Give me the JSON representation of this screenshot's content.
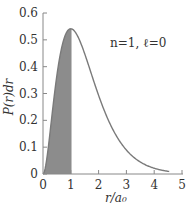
{
  "chart_data": {
    "type": "area",
    "title": "",
    "annotation": "n=1,  ℓ=0",
    "xlabel": "r/a₀",
    "ylabel": "P(r)dr",
    "xlim": [
      0,
      5
    ],
    "ylim": [
      0,
      0.6
    ],
    "xticks": [
      "0",
      "1",
      "2",
      "3",
      "4",
      "5"
    ],
    "yticks": [
      "0",
      "0.1",
      "0.2",
      "0.3",
      "0.4",
      "0.5",
      "0.6"
    ],
    "grid": false,
    "legend": null,
    "series": [
      {
        "name": "P(r) = 4 (r/a0)^2 exp(-2r/a0)",
        "x": [
          0,
          0.25,
          0.5,
          0.75,
          1.0,
          1.25,
          1.5,
          1.75,
          2.0,
          2.5,
          3.0,
          3.5,
          4.0,
          4.5
        ],
        "values": [
          0,
          0.152,
          0.368,
          0.502,
          0.541,
          0.513,
          0.448,
          0.37,
          0.293,
          0.168,
          0.089,
          0.045,
          0.021,
          0.01
        ]
      }
    ],
    "shaded_region": {
      "x_from": 0,
      "x_to": 1,
      "color": "#8c8c8c"
    },
    "colors": {
      "curve": "#7a7a7a",
      "axis": "#888888",
      "fill": "#8c8c8c"
    }
  }
}
